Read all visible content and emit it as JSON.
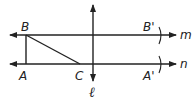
{
  "diagram": {
    "type": "geometry",
    "lines": {
      "m": {
        "label": "m"
      },
      "n": {
        "label": "n"
      },
      "l": {
        "label": "ℓ"
      }
    },
    "points": {
      "A": "A",
      "B": "B",
      "C": "C",
      "A_prime": "A'",
      "B_prime": "B'"
    },
    "colors": {
      "stroke": "#222222",
      "background": "#ffffff"
    }
  }
}
